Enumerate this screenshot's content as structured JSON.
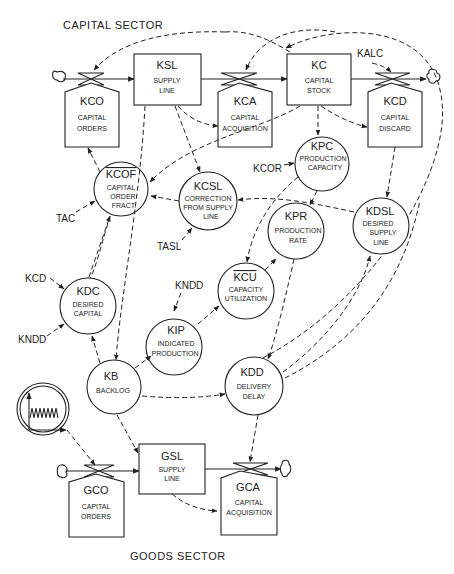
{
  "sectors": {
    "capital": "CAPITAL SECTOR",
    "goods": "GOODS SECTOR"
  },
  "levels": {
    "ksl": {
      "code": "KSL",
      "line1": "SUPPLY",
      "line2": "LINE"
    },
    "kc": {
      "code": "KC",
      "line1": "CAPITAL",
      "line2": "STOCK"
    },
    "gsl": {
      "code": "GSL",
      "line1": "SUPPLY",
      "line2": "LINE"
    }
  },
  "rates": {
    "kco": {
      "code": "KCO",
      "line1": "CAPITAL",
      "line2": "ORDERS"
    },
    "kca": {
      "code": "KCA",
      "line1": "CAPITAL",
      "line2": "ACQUISITION"
    },
    "kcd": {
      "code": "KCD",
      "line1": "CAPITAL",
      "line2": "DISCARD"
    },
    "gco": {
      "code": "GCO",
      "line1": "CAPITAL",
      "line2": "ORDERS"
    },
    "gca": {
      "code": "GCA",
      "line1": "CAPITAL",
      "line2": "ACQUISITION"
    }
  },
  "auxiliaries": {
    "kcof": {
      "code": "KCOF",
      "line1": "CAPITAL",
      "line2": "ORDER",
      "line3": "FRACT."
    },
    "kcsl": {
      "code": "KCSL",
      "line1": "CORRECTION",
      "line2": "FROM SUPPLY",
      "line3": "LINE"
    },
    "kpc": {
      "code": "KPC",
      "line1": "PRODUCTION",
      "line2": "CAPACITY"
    },
    "kpr": {
      "code": "KPR",
      "line1": "PRODUCTION",
      "line2": "RATE"
    },
    "kdsl": {
      "code": "KDSL",
      "line1": "DESIRED",
      "line2": "SUPPLY",
      "line3": "LINE"
    },
    "kcu": {
      "code": "KCU",
      "line1": "CAPACITY",
      "line2": "UTILIZATION"
    },
    "kdc": {
      "code": "KDC",
      "line1": "DESIRED",
      "line2": "CAPITAL"
    },
    "kip": {
      "code": "KIP",
      "line1": "INDICATED",
      "line2": "PRODUCTION"
    },
    "kb": {
      "code": "KB",
      "line1": "BACKLOG"
    },
    "kdd": {
      "code": "KDD",
      "line1": "DELIVERY",
      "line2": "DELAY"
    }
  },
  "constants": {
    "kalc": "KALC",
    "kcor": "KCOR",
    "tac": "TAC",
    "tasl": "TASL",
    "kcd": "KCD",
    "kndd_left": "KNDD",
    "kndd_kip": "KNDD"
  },
  "exogenous_input": {
    "icon": "oscillating-input-icon"
  }
}
